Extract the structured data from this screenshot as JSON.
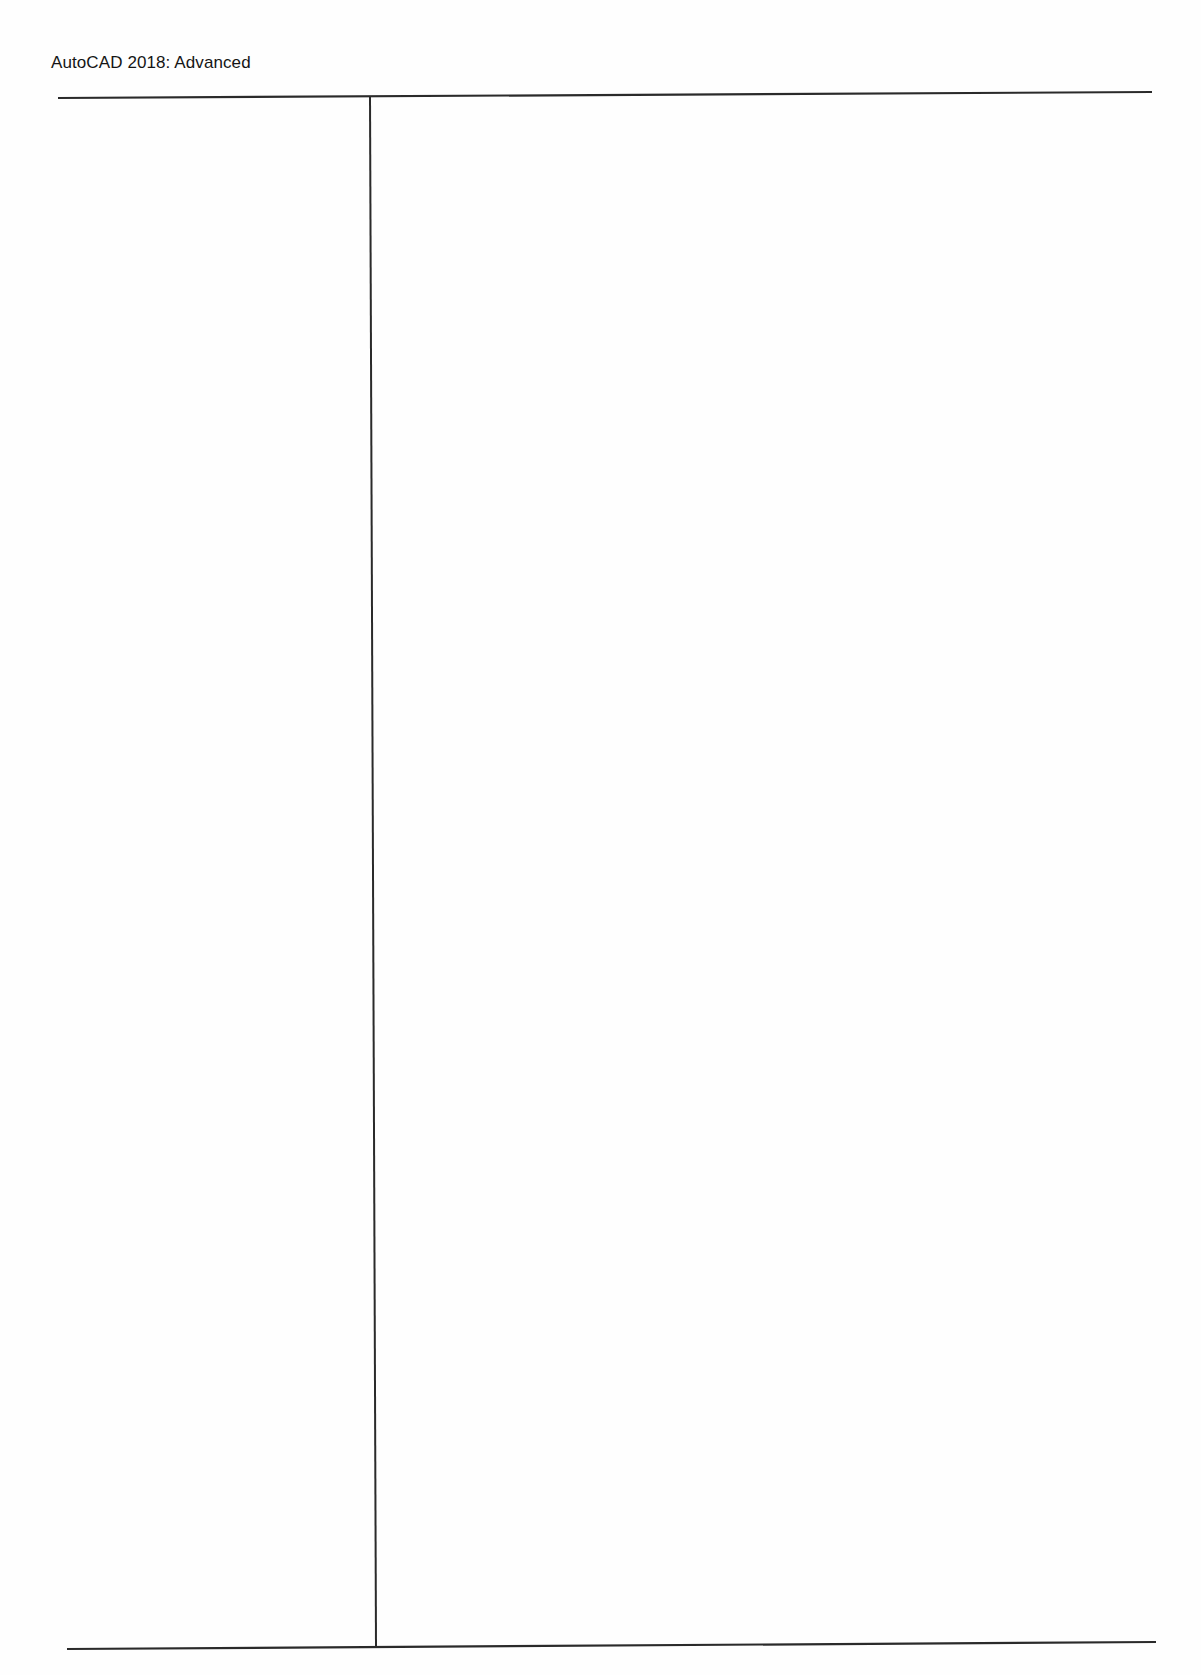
{
  "document": {
    "running_header": "AutoCAD 2018: Advanced",
    "page_type": "notes",
    "layout": {
      "columns": 2,
      "left_column": {
        "content": ""
      },
      "right_column": {
        "content": ""
      }
    }
  }
}
